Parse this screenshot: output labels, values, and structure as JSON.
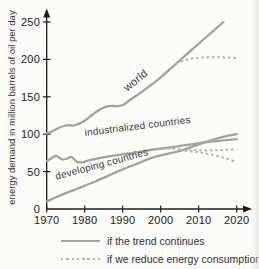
{
  "colors": {
    "background": "#fcfcf8",
    "solid_line": "#a5a29d",
    "dashed_line": "#b7b4af",
    "axis": "#1d1d1b",
    "text": "#2e2d2b"
  },
  "chart_data": {
    "type": "line",
    "title": "",
    "xlabel": "",
    "ylabel": "energy demand in million barrels of oil per day",
    "y_unit": "million barrels of oil per day",
    "xlim": [
      1970,
      2023
    ],
    "ylim": [
      0,
      260
    ],
    "grid": false,
    "x_ticks": [
      1970,
      1980,
      1990,
      2000,
      2010,
      2020
    ],
    "y_ticks": [
      0,
      50,
      100,
      150,
      200,
      250
    ],
    "legend_position": "bottom",
    "legend": [
      {
        "style": "solid",
        "label": "if the trend continues"
      },
      {
        "style": "dashed",
        "label": "if we reduce energy consumption"
      }
    ],
    "line_labels": [
      {
        "text": "world"
      },
      {
        "text": "industrialized countries"
      },
      {
        "text": "developing countries"
      }
    ],
    "series": [
      {
        "name": "world - if the trend continues",
        "style": "solid",
        "points": [
          [
            1970,
            101
          ],
          [
            1971.5,
            104
          ],
          [
            1973,
            108
          ],
          [
            1974.5,
            111
          ],
          [
            1976,
            112
          ],
          [
            1977,
            111.5
          ],
          [
            1978,
            113
          ],
          [
            1980,
            118
          ],
          [
            1982,
            126
          ],
          [
            1984,
            133
          ],
          [
            1985.5,
            136.5
          ],
          [
            1987,
            138
          ],
          [
            1988.5,
            137.5
          ],
          [
            1990,
            139
          ],
          [
            1992,
            146
          ],
          [
            1994,
            153
          ],
          [
            1997,
            164
          ],
          [
            2000,
            176
          ],
          [
            2004,
            194
          ],
          [
            2008,
            212
          ],
          [
            2012,
            230
          ],
          [
            2016.5,
            250
          ]
        ]
      },
      {
        "name": "world - if we reduce energy consumption",
        "style": "dashed",
        "points": [
          [
            2004,
            194
          ],
          [
            2006,
            198
          ],
          [
            2008,
            201
          ],
          [
            2011,
            202.5
          ],
          [
            2015,
            203
          ],
          [
            2020,
            202
          ]
        ]
      },
      {
        "name": "industrialized countries - if the trend continues",
        "style": "solid",
        "points": [
          [
            1970,
            64
          ],
          [
            1971,
            67
          ],
          [
            1972.5,
            71
          ],
          [
            1974,
            66.5
          ],
          [
            1975.5,
            67.5
          ],
          [
            1976.5,
            69.5
          ],
          [
            1978,
            63
          ],
          [
            1979.5,
            62.5
          ],
          [
            1981,
            65
          ],
          [
            1983,
            67
          ],
          [
            1986,
            70
          ],
          [
            1990,
            73
          ],
          [
            1994,
            76
          ],
          [
            1998,
            79.5
          ],
          [
            2002,
            82
          ],
          [
            2006,
            85
          ],
          [
            2010,
            88
          ],
          [
            2014,
            90.5
          ],
          [
            2020,
            93.5
          ]
        ]
      },
      {
        "name": "industrialized countries - if we reduce energy consumption",
        "style": "dashed",
        "points": [
          [
            1999,
            80
          ],
          [
            2002,
            80.5
          ],
          [
            2006,
            80
          ],
          [
            2010,
            78.5
          ],
          [
            2014,
            78.5
          ],
          [
            2017,
            79
          ],
          [
            2020,
            80
          ]
        ]
      },
      {
        "name": "developing countries - if the trend continues",
        "style": "solid",
        "points": [
          [
            1970,
            10
          ],
          [
            1974,
            19
          ],
          [
            1978,
            27
          ],
          [
            1982,
            35
          ],
          [
            1986,
            44
          ],
          [
            1990,
            53
          ],
          [
            1994,
            61
          ],
          [
            1998,
            69
          ],
          [
            2002,
            74
          ],
          [
            2006,
            79
          ],
          [
            2010,
            86.5
          ],
          [
            2014,
            93
          ],
          [
            2017,
            97
          ],
          [
            2020,
            100
          ]
        ]
      },
      {
        "name": "developing countries - if we reduce energy consumption",
        "style": "dashed",
        "points": [
          [
            2005,
            79
          ],
          [
            2008,
            77
          ],
          [
            2011,
            75
          ],
          [
            2014,
            72
          ],
          [
            2017,
            68
          ],
          [
            2020,
            62.5
          ]
        ]
      }
    ]
  }
}
